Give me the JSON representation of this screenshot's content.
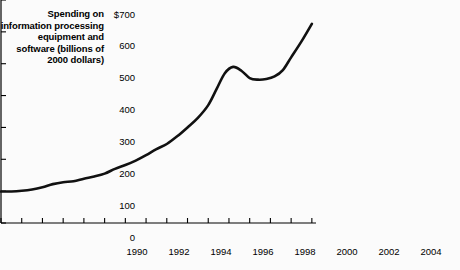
{
  "chart_data": {
    "type": "line",
    "title": "Spending on information processing equipment and software (billions of 2000 dollars)",
    "xlabel": "",
    "ylabel": "",
    "xlim": [
      1990,
      2005.2
    ],
    "ylim": [
      0,
      700
    ],
    "grid": false,
    "legend": "none",
    "line_color": "#111111",
    "background_color": "#fbfbfb",
    "ytick_labels": [
      "$700",
      "600",
      "500",
      "400",
      "300",
      "200",
      "100",
      "0"
    ],
    "ytick_values": [
      700,
      600,
      500,
      400,
      300,
      200,
      100,
      0
    ],
    "xtick_labels": [
      "1990",
      "1992",
      "1994",
      "1996",
      "1998",
      "2000",
      "2002",
      "2004"
    ],
    "xtick_values": [
      1990,
      1992,
      1994,
      1996,
      1998,
      2000,
      2002,
      2004
    ],
    "xtick_minor_values": [
      1991,
      1993,
      1995,
      1997,
      1999,
      2001,
      2003,
      2005
    ],
    "x": [
      1990.0,
      1990.5,
      1991.0,
      1991.5,
      1992.0,
      1992.5,
      1993.0,
      1993.5,
      1994.0,
      1994.5,
      1995.0,
      1995.5,
      1996.0,
      1996.5,
      1997.0,
      1997.5,
      1998.0,
      1998.5,
      1999.0,
      1999.5,
      2000.0,
      2000.4,
      2000.8,
      2001.2,
      2001.6,
      2002.0,
      2002.4,
      2002.8,
      2003.2,
      2003.6,
      2004.0,
      2004.5,
      2005.0
    ],
    "values": [
      99,
      99,
      101,
      105,
      112,
      122,
      128,
      131,
      139,
      146,
      155,
      170,
      182,
      196,
      213,
      232,
      248,
      272,
      300,
      330,
      370,
      420,
      470,
      490,
      478,
      455,
      450,
      452,
      460,
      480,
      520,
      570,
      625
    ],
    "annotations": []
  },
  "ytick_label_0": "$700",
  "ytick_label_1": "600",
  "ytick_label_2": "500",
  "ytick_label_3": "400",
  "ytick_label_4": "300",
  "ytick_label_5": "200",
  "ytick_label_6": "100",
  "ytick_label_7": "0",
  "xtick_label_0": "1990",
  "xtick_label_1": "1992",
  "xtick_label_2": "1994",
  "xtick_label_3": "1996",
  "xtick_label_4": "1998",
  "xtick_label_5": "2000",
  "xtick_label_6": "2002",
  "xtick_label_7": "2004"
}
